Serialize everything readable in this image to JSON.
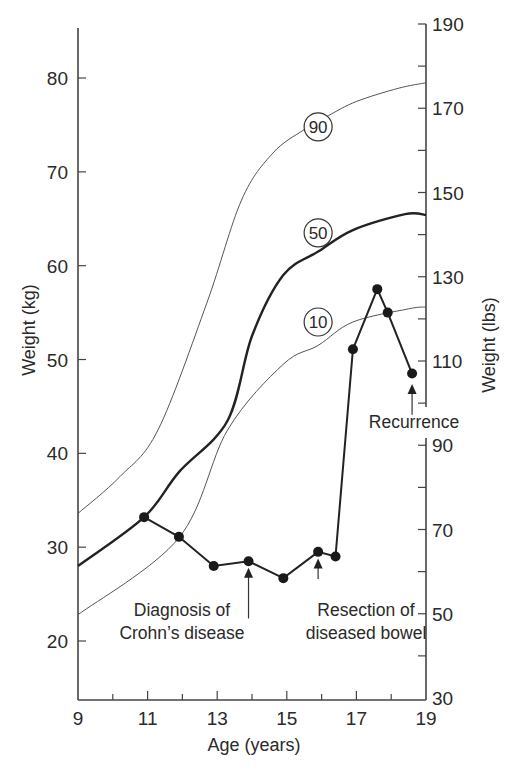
{
  "chart_data": {
    "type": "line",
    "title": "",
    "xlabel": "Age (years)",
    "ylabel": "Weight (kg)",
    "ylabel_right": "Weight (lbs)",
    "xlim": [
      9,
      19
    ],
    "ylim": [
      12.9,
      85.5
    ],
    "ylim_right": [
      30,
      190
    ],
    "x_ticks": [
      9,
      10,
      11,
      12,
      13,
      14,
      15,
      16,
      17,
      18,
      19
    ],
    "x_tick_labels": [
      "9",
      "11",
      "13",
      "15",
      "17",
      "19"
    ],
    "y_ticks": [
      20,
      30,
      40,
      50,
      60,
      70,
      80
    ],
    "y_tick_labels": [
      "20",
      "30",
      "40",
      "50",
      "60",
      "70",
      "80"
    ],
    "y_right_ticks": [
      30,
      40,
      50,
      60,
      70,
      80,
      90,
      100,
      110,
      120,
      130,
      140,
      150,
      160,
      170,
      180,
      190
    ],
    "y_right_tick_labels": [
      "30",
      "50",
      "70",
      "90",
      "110",
      "130",
      "150",
      "170",
      "190"
    ],
    "grid": false,
    "legend": "none (percentile curves labelled inline)",
    "series": [
      {
        "name": "90th percentile",
        "label": "90",
        "style": "thin",
        "x": [
          9.0,
          10.2,
          11.3,
          12.7,
          13.7,
          14.6,
          15.5,
          16.2,
          17.0,
          18.2,
          19.0
        ],
        "y": [
          33.6,
          37.5,
          42.5,
          56.0,
          67.0,
          72.0,
          74.5,
          76.0,
          77.5,
          78.9,
          79.5
        ]
      },
      {
        "name": "50th percentile",
        "label": "50",
        "style": "bold",
        "x": [
          9.0,
          10.9,
          11.9,
          13.3,
          14.0,
          14.9,
          15.9,
          16.9,
          18.4,
          19.0
        ],
        "y": [
          28.0,
          33.2,
          38.0,
          43.5,
          52.5,
          59.0,
          61.5,
          63.8,
          65.5,
          65.4
        ]
      },
      {
        "name": "10th percentile",
        "label": "10",
        "style": "thin",
        "x": [
          9.0,
          11.9,
          13.3,
          14.9,
          15.9,
          16.9,
          18.5,
          19.0
        ],
        "y": [
          22.8,
          31.0,
          42.5,
          49.5,
          51.5,
          54.0,
          55.4,
          55.6
        ]
      },
      {
        "name": "Patient weight",
        "style": "markers+line",
        "x": [
          10.9,
          11.9,
          12.9,
          13.9,
          14.9,
          15.9,
          16.4,
          16.9,
          17.6,
          17.9,
          18.6
        ],
        "y": [
          33.2,
          31.1,
          28.0,
          28.5,
          26.7,
          29.5,
          29.0,
          51.1,
          57.5,
          55.0,
          48.5
        ]
      }
    ],
    "percentile_labels": [
      {
        "text": "90",
        "x": 15.9,
        "y": 74.8
      },
      {
        "text": "50",
        "x": 15.9,
        "y": 63.5
      },
      {
        "text": "10",
        "x": 15.9,
        "y": 54.0
      }
    ],
    "annotations": [
      {
        "lines": [
          "Diagnosis of",
          "Crohn’s disease"
        ],
        "arrow_x": 13.9,
        "arrow_from_y": 22.4,
        "arrow_to_y": 27.8
      },
      {
        "lines": [
          "Resection of",
          "diseased bowel"
        ],
        "arrow_x": 15.9,
        "arrow_from_y": 26.6,
        "arrow_to_y": 28.8
      },
      {
        "lines": [
          "Recurrence"
        ],
        "arrow_x": 18.6,
        "arrow_from_y": 44.1,
        "arrow_to_y": 47.4
      }
    ]
  }
}
